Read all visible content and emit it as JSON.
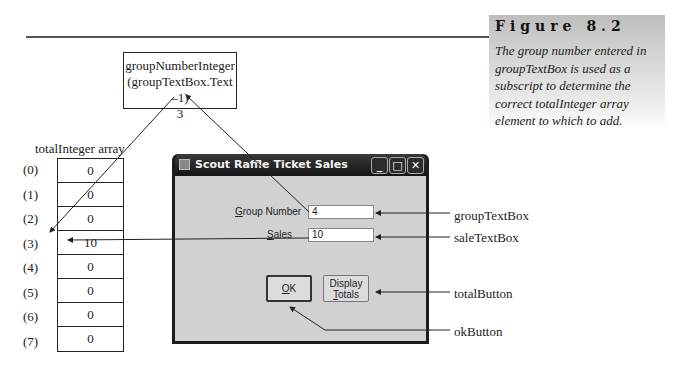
{
  "figure": {
    "title": "Figure 8.2",
    "caption": "The group number entered in groupTextBox is used as a subscript to determine the correct totalInteger array element to which to add."
  },
  "group_number_box": {
    "line1": "groupNumberInteger",
    "line2": "(groupTextBox.Text –1)",
    "value": "3"
  },
  "array": {
    "title": "totalInteger array",
    "indices": [
      "(0)",
      "(1)",
      "(2)",
      "(3)",
      "(4)",
      "(5)",
      "(6)",
      "(7)"
    ],
    "values": [
      "0",
      "0",
      "0",
      "10",
      "0",
      "0",
      "0",
      "0"
    ]
  },
  "window": {
    "title": "Scout Raffle Ticket Sales",
    "minimize_glyph": "_",
    "maximize_glyph": "□",
    "close_glyph": "✕",
    "group_label_accel": "G",
    "group_label_rest": "roup Number",
    "group_value": "4",
    "sales_label_accel": "S",
    "sales_label_rest": "ales",
    "sales_value": "10",
    "ok_accel": "O",
    "ok_rest": "K",
    "display_line1": "Display",
    "display_accel": "T",
    "display_rest": "otals"
  },
  "callouts": {
    "group_textbox": "groupTextBox",
    "sale_textbox": "saleTextBox",
    "total_button": "totalButton",
    "ok_button": "okButton"
  }
}
